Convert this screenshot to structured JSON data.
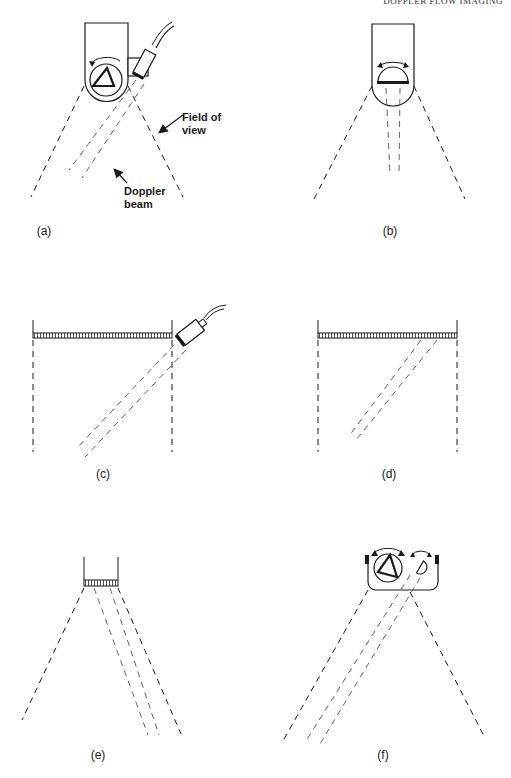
{
  "header": {
    "running_title": "DOPPLER FLOW IMAGING"
  },
  "panels": [
    {
      "id": "a",
      "caption": "(a)",
      "description": "Rotating mechanical sector scanner with separate offset Doppler transducer",
      "annotations": [
        "Field of view",
        "Doppler beam"
      ]
    },
    {
      "id": "b",
      "caption": "(b)",
      "description": "Oscillating single-element mechanical sector probe with Doppler beam"
    },
    {
      "id": "c",
      "caption": "(c)",
      "description": "Linear array with separate angled Doppler transducer"
    },
    {
      "id": "d",
      "caption": "(d)",
      "description": "Linear array with electronically steered Doppler beam"
    },
    {
      "id": "e",
      "caption": "(e)",
      "description": "Phased array sector probe with steered Doppler beam"
    },
    {
      "id": "f",
      "caption": "(f)",
      "description": "Rotating imaging wheel with oscillating Doppler transducer"
    }
  ],
  "annotations": {
    "field_of_view": {
      "line1": "Field of",
      "line2": "view"
    },
    "doppler_beam": {
      "line1": "Doppler",
      "line2": "beam"
    }
  },
  "colors": {
    "ink": "#1a1a1a",
    "beam": "#555555",
    "background": "#ffffff"
  }
}
